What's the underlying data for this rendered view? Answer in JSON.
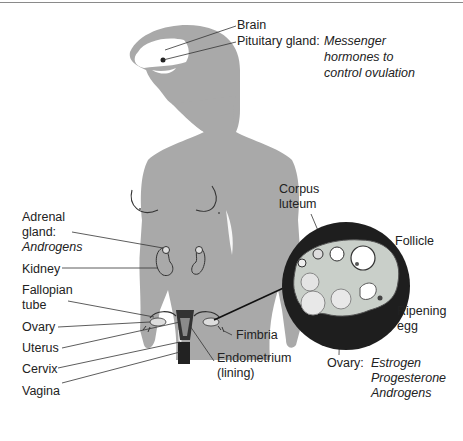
{
  "diagram": {
    "labels": {
      "brain": "Brain",
      "pituitary": "Pituitary gland:",
      "pituitary_note": [
        "Messenger",
        "hormones to",
        "control ovulation"
      ],
      "adrenal": [
        "Adrenal",
        "gland:"
      ],
      "adrenal_note": "Androgens",
      "kidney": "Kidney",
      "fallopian": [
        "Fallopian",
        "tube"
      ],
      "ovary": "Ovary",
      "uterus": "Uterus",
      "cervix": "Cervix",
      "vagina": "Vagina",
      "fimbria": "Fimbria",
      "endometrium": [
        "Endometrium",
        "(lining)"
      ],
      "corpus_luteum": [
        "Corpus",
        "luteum"
      ],
      "follicle": "Follicle",
      "ripening_egg": [
        "Ripening",
        "egg"
      ],
      "ovary_detail": "Ovary:",
      "ovary_hormones": [
        "Estrogen",
        "Progesterone",
        "Androgens"
      ]
    },
    "colors": {
      "silhouette": "#a9a9a9",
      "organ_dark": "#2a2a2a",
      "inset_ring": "#1e1e1e",
      "ovary_tissue": "#c9cfc9",
      "line": "#333333"
    }
  }
}
